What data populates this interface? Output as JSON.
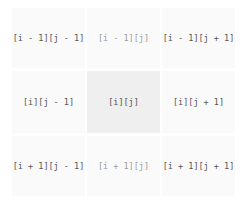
{
  "grid": {
    "rows": [
      [
        {
          "label": "[i - 1][j - 1]",
          "style": "normal"
        },
        {
          "label": "[i - 1][j]",
          "style": "faded"
        },
        {
          "label": "[i - 1][j + 1]",
          "style": "normal"
        }
      ],
      [
        {
          "label": "[i][j - 1]",
          "style": "normal"
        },
        {
          "label": "[i][j]",
          "style": "highlighted"
        },
        {
          "label": "[i][j + 1]",
          "style": "normal"
        }
      ],
      [
        {
          "label": "[i + 1][j - 1]",
          "style": "normal"
        },
        {
          "label": "[i + 1][j]",
          "style": "faded"
        },
        {
          "label": "[i + 1][j + 1]",
          "style": "normal"
        }
      ]
    ]
  },
  "colors": {
    "cell_background": "#fafafa",
    "center_background": "#efefef",
    "text": "#555555",
    "faded_text": "#9a9a9a"
  }
}
